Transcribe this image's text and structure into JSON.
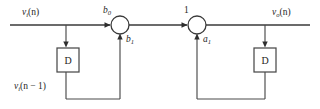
{
  "diagram": {
    "type": "signal-flow-graph",
    "background_color": "#ffffff",
    "line_color": "#3a3a3a",
    "text_color": "#1e1e1e",
    "signals": {
      "input_label_base": "v",
      "input_label_sub": "i",
      "input_label_arg": "(n)",
      "delayed_input_base": "v",
      "delayed_input_sub": "i",
      "delayed_input_arg": "(n − 1)",
      "output_label_base": "v",
      "output_label_sub": "o",
      "output_label_arg": "(n)"
    },
    "nodes": [
      {
        "id": "summer-1",
        "kind": "summing-junction",
        "cx": 120,
        "cy": 25,
        "r": 9,
        "top_coefficient_base": "b",
        "top_coefficient_sub": "0",
        "bottom_coefficient_base": "b",
        "bottom_coefficient_sub": "1"
      },
      {
        "id": "summer-2",
        "kind": "summing-junction",
        "cx": 197,
        "cy": 25,
        "r": 9,
        "top_coefficient_base": "1",
        "top_coefficient_sub": "",
        "bottom_coefficient_base": "a",
        "bottom_coefficient_sub": "1"
      }
    ],
    "delay_elements": [
      {
        "id": "delay-left",
        "label": "D",
        "x": 57,
        "y": 48,
        "w": 22,
        "h": 24
      },
      {
        "id": "delay-right",
        "label": "D",
        "x": 254,
        "y": 48,
        "w": 22,
        "h": 24
      }
    ],
    "coefficients": {
      "b0": "b",
      "b0_sub": "0",
      "b1": "b",
      "b1_sub": "1",
      "a1": "a",
      "a1_sub": "1",
      "unity": "1"
    }
  }
}
